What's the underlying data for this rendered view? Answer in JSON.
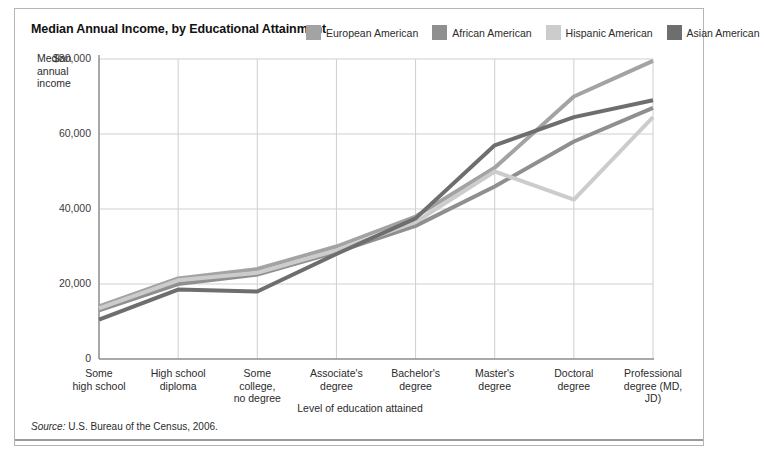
{
  "chart_title": "Median Annual Income, by Educational Attainment",
  "y_axis_title": "Median annual income",
  "x_axis_title": "Level of education attained",
  "source_note": {
    "prefix": "Source:",
    "text": " U.S. Bureau of the Census, 2006."
  },
  "legend": {
    "items": [
      {
        "label": "European American",
        "color": "#a3a3a3"
      },
      {
        "label": "African American",
        "color": "#8f8f8f"
      },
      {
        "label": "Hispanic American",
        "color": "#cccccc"
      },
      {
        "label": "Asian American",
        "color": "#6e6e6e"
      }
    ]
  },
  "chart_data": {
    "type": "line",
    "title": "Median Annual Income, by Educational Attainment",
    "xlabel": "Level of education attained",
    "ylabel": "Median annual income",
    "ylim": [
      0,
      80000
    ],
    "ytick_labels": [
      "$80,000",
      "60,000",
      "40,000",
      "20,000",
      "0"
    ],
    "ytick_values": [
      80000,
      60000,
      40000,
      20000,
      0
    ],
    "grid": true,
    "legend_position": "top-right",
    "categories": [
      "Some\nhigh school",
      "High school\ndiploma",
      "Some\ncollege,\nno degree",
      "Associate's\ndegree",
      "Bachelor's\ndegree",
      "Master's\ndegree",
      "Doctoral\ndegree",
      "Professional\ndegree (MD,\nJD)"
    ],
    "series": [
      {
        "name": "European American",
        "color": "#a3a3a3",
        "values": [
          14000,
          21500,
          24000,
          30000,
          38000,
          51000,
          70000,
          79500
        ]
      },
      {
        "name": "African American",
        "color": "#8f8f8f",
        "values": [
          13000,
          20000,
          22500,
          28500,
          35500,
          46000,
          58000,
          67000
        ]
      },
      {
        "name": "Hispanic American",
        "color": "#cccccc",
        "values": [
          13500,
          21000,
          23000,
          29000,
          36500,
          50000,
          42500,
          64500
        ]
      },
      {
        "name": "Asian American",
        "color": "#6e6e6e",
        "values": [
          10500,
          18500,
          18000,
          28000,
          37500,
          57000,
          64500,
          69000
        ]
      }
    ]
  }
}
